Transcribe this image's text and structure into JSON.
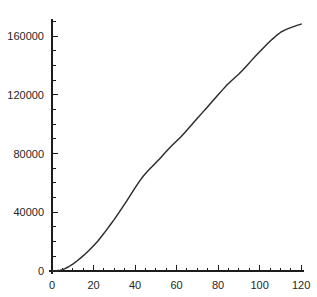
{
  "chart_data": {
    "type": "line",
    "title": "",
    "subtitle": "",
    "xlabel": "",
    "ylabel": "",
    "xlim": [
      0,
      124
    ],
    "ylim": [
      0,
      172000
    ],
    "grid": false,
    "legend": null,
    "axis_color": "#1c1c1c",
    "line_color": "#2b2b2b",
    "background": "#ffffff",
    "x_ticks_major": [
      0,
      20,
      40,
      60,
      80,
      100,
      120
    ],
    "x_tick_labels": [
      "0",
      "20",
      "40",
      "60",
      "80",
      "100",
      "120"
    ],
    "x_ticks_minor": [
      5,
      10,
      15,
      25,
      30,
      35,
      45,
      50,
      55,
      65,
      70,
      75,
      85,
      90,
      95,
      105,
      110,
      115
    ],
    "y_ticks_major": [
      0,
      40000,
      80000,
      120000,
      160000
    ],
    "y_tick_labels": [
      "0",
      "40000",
      "80000",
      "120000",
      "160000"
    ],
    "y_ticks_minor": [
      10000,
      20000,
      30000,
      50000,
      60000,
      70000,
      90000,
      100000,
      110000,
      130000,
      140000,
      150000,
      170000
    ],
    "series": [
      {
        "name": "cumulative",
        "x": [
          0,
          2,
          4,
          5,
          6,
          8,
          10,
          12,
          14,
          16,
          18,
          20,
          22,
          24,
          26,
          28,
          30,
          32,
          34,
          36,
          38,
          40,
          42,
          44,
          46,
          48,
          50,
          52,
          54,
          56,
          58,
          60,
          62,
          64,
          66,
          68,
          70,
          72,
          74,
          76,
          78,
          80,
          82,
          84,
          86,
          88,
          90,
          92,
          94,
          96,
          98,
          100,
          102,
          104,
          106,
          108,
          110,
          112,
          114,
          116,
          118,
          120
        ],
        "values": [
          0,
          150,
          500,
          900,
          1500,
          2900,
          4700,
          6800,
          9100,
          11600,
          14300,
          17200,
          20300,
          23800,
          27500,
          31300,
          35200,
          39300,
          43500,
          47800,
          52200,
          56600,
          60900,
          64700,
          67900,
          70800,
          73700,
          76700,
          79800,
          82900,
          85800,
          88500,
          91300,
          94400,
          97600,
          100800,
          104000,
          107200,
          110400,
          113600,
          116800,
          120000,
          123200,
          126300,
          129100,
          131600,
          134200,
          137100,
          140200,
          143300,
          146400,
          149400,
          152300,
          155100,
          157800,
          160300,
          162500,
          164100,
          165300,
          166300,
          167300,
          168200
        ]
      }
    ]
  }
}
